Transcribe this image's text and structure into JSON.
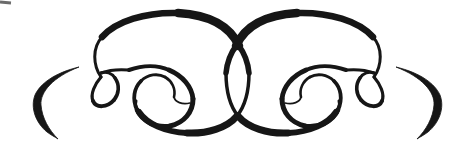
{
  "meta": {
    "background_color": "#ffffff",
    "ink_color": "#161616"
  },
  "ornament": {
    "canvas": {
      "width": 475,
      "height": 155
    },
    "mirror_transform": "translate(475 0) scale(-1 1)",
    "fills": [
      {
        "name": "end-crescent",
        "d": "M 79,67 C 54,73 40,84 35,95 C 30,108 36,123 47,132 C 51,135 55,137 58,139 C 49,130 42,118 41,105 C 40,92 53,77 79,67 Z"
      }
    ],
    "strokes": [
      {
        "name": "circle-left-side",
        "d": "M 101,77 C 93,65 92,48 102,37",
        "w": 3.0
      },
      {
        "name": "circle-top-left",
        "d": "M 102,37 C 116,21 146,12 178,13",
        "w": 6.5
      },
      {
        "name": "circle-top-right",
        "d": "M 178,13 C 212,15 231,28 239,46",
        "w": 8.5
      },
      {
        "name": "vesica-upper",
        "d": "M 239,46 C 245,54 248,63 249,73",
        "w": 5.5
      },
      {
        "name": "vesica-lower",
        "d": "M 249,73 C 249,91 245,106 237,116",
        "w": 3.5
      },
      {
        "name": "bottom-sweep-inner",
        "d": "M 237,116 C 227,128 207,134 187,133",
        "w": 7.0
      },
      {
        "name": "bottom-sweep-outer",
        "d": "M 187,133 C 165,132 147,124 139,112",
        "w": 6.0
      },
      {
        "name": "bottom-sweep-taper",
        "d": "M 139,112 C 136,108 135,104 136,101",
        "w": 3.0
      },
      {
        "name": "side-loop-left",
        "d": "M 101,77 C 95,84 90,94 93,101",
        "w": 3.2
      },
      {
        "name": "side-loop-bottom",
        "d": "M 93,101 C 96,108 107,108 114,100",
        "w": 4.0
      },
      {
        "name": "side-loop-right",
        "d": "M 114,100 C 119,94 120,85 115,78",
        "w": 3.6
      },
      {
        "name": "side-loop-close",
        "d": "M 115,78 C 112,73 106,71 101,73",
        "w": 3.0
      },
      {
        "name": "loop-exit-east",
        "d": "M 101,73 C 109,70 118,69 129,70",
        "w": 3.0
      },
      {
        "name": "spiral-top",
        "d": "M 129,70 C 143,65 158,65 169,70",
        "w": 4.0
      },
      {
        "name": "spiral-right",
        "d": "M 169,70 C 183,76 192,87 193,99",
        "w": 4.8
      },
      {
        "name": "spiral-bottom-right",
        "d": "M 193,99 C 193,112 184,123 170,126",
        "w": 5.0
      },
      {
        "name": "spiral-bottom-left",
        "d": "M 170,126 C 155,128 142,121 137,110",
        "w": 4.6
      },
      {
        "name": "spiral-left-rise",
        "d": "M 137,110 C 132,99 134,88 141,81",
        "w": 3.8
      },
      {
        "name": "spiral-inner-top",
        "d": "M 141,81 C 148,74 158,73 165,77",
        "w": 3.0
      },
      {
        "name": "spiral-inner-right",
        "d": "M 165,77 C 172,81 176,89 174,97",
        "w": 2.6
      },
      {
        "name": "spiral-inner-tip",
        "d": "M 174,97 C 175,102 182,105 190,103",
        "w": 1.7
      }
    ],
    "artifacts": [
      {
        "name": "scan-mark",
        "d": "M 0,2 L 11,3",
        "w": 3,
        "color": "#3a3a3a",
        "opacity": 0.75
      }
    ]
  }
}
